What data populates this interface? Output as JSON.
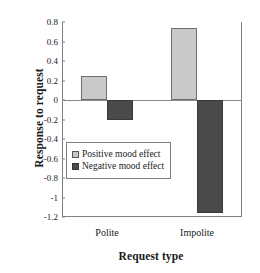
{
  "chart_data": {
    "type": "bar",
    "title": "",
    "xlabel": "Request type",
    "ylabel": "Response to request",
    "categories": [
      "Polite",
      "Impolite"
    ],
    "series": [
      {
        "name": "Positive mood effect",
        "values": [
          0.25,
          0.74
        ],
        "color": "#c9c9c9"
      },
      {
        "name": "Negative mood effect",
        "values": [
          -0.2,
          -1.16
        ],
        "color": "#4a4a4a"
      }
    ],
    "ylim": [
      -1.2,
      0.8
    ],
    "yticks": [
      "0.8",
      "0.6",
      "0.4",
      "0.2",
      "0",
      "-0.2",
      "-0.4",
      "-0.6",
      "-0.8",
      "-1",
      "-1.2"
    ],
    "ytick_values": [
      0.8,
      0.6,
      0.4,
      0.2,
      0,
      -0.2,
      -0.4,
      -0.6,
      -0.8,
      -1.0,
      -1.2
    ],
    "grid": false,
    "legend_position": "center-left-inside",
    "zero_line": true
  }
}
